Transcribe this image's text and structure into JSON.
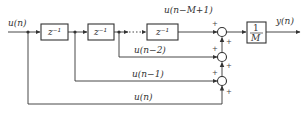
{
  "diagram": {
    "type": "moving-average-filter-block-diagram",
    "input_label": "u(n)",
    "output_label": "y(n)",
    "delay_blocks": [
      {
        "label": "z⁻¹"
      },
      {
        "label": "z⁻¹"
      },
      {
        "label": "z⁻¹"
      }
    ],
    "gain_block": {
      "numerator": "1",
      "denominator": "M"
    },
    "tap_labels": {
      "top": "u(n−M+1)",
      "tap2": "u(n−2)",
      "tap1": "u(n−1)",
      "tap0": "u(n)"
    },
    "summer_signs": [
      "+",
      "+",
      "+",
      "+",
      "+",
      "+"
    ],
    "colors": {
      "line": "#333333",
      "background": "#ffffff"
    }
  }
}
